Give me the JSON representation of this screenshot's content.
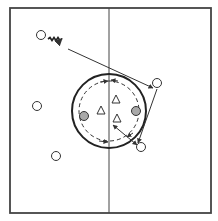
{
  "diagram": {
    "type": "sports-drill",
    "colors": {
      "background": "#ffffff",
      "line": "#333333",
      "shaded_player": "#a9a9a9"
    },
    "field": {
      "x": 10,
      "y": 8,
      "width": 201,
      "height": 205,
      "midline_x": 109
    },
    "center_circle": {
      "cx": 109,
      "cy": 111,
      "r": 37
    },
    "dashed_circle": {
      "cx": 109,
      "cy": 111,
      "r": 30
    },
    "players_open": [
      {
        "id": "p1",
        "x": 41,
        "y": 35
      },
      {
        "id": "p2",
        "x": 157,
        "y": 83
      },
      {
        "id": "p3",
        "x": 37,
        "y": 106
      },
      {
        "id": "p4",
        "x": 141,
        "y": 147
      },
      {
        "id": "p5",
        "x": 56,
        "y": 156
      }
    ],
    "players_shaded": [
      {
        "id": "s1",
        "x": 84,
        "y": 116
      },
      {
        "id": "s2",
        "x": 136,
        "y": 111
      }
    ],
    "defenders": [
      {
        "id": "d1",
        "x": 101,
        "y": 111
      },
      {
        "id": "d2",
        "x": 116,
        "y": 100
      },
      {
        "id": "d3",
        "x": 117,
        "y": 119
      }
    ]
  }
}
